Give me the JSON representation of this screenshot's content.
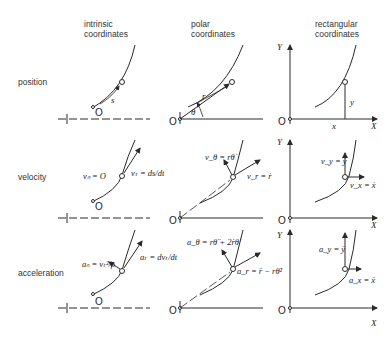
{
  "columns": {
    "intrinsic": [
      "intrinsic",
      "coordinates"
    ],
    "polar": [
      "polar",
      "coordinates"
    ],
    "rectangular": [
      "rectangular",
      "coordinates"
    ]
  },
  "rows": {
    "position": "position",
    "velocity": "velocity",
    "acceleration": "acceleration"
  },
  "labels": {
    "origin": "O",
    "s": "s",
    "r": "r",
    "theta": "θ",
    "x": "x",
    "y": "y",
    "X": "X",
    "Y": "Y",
    "vn": "vₙ = O",
    "vt": "vₜ = ds/dt",
    "vtheta": "v_θ = rθ̇",
    "vr": "v_r = ṙ",
    "vy": "v_y = ẏ",
    "vx": "v_x = ẋ",
    "an": "aₙ = vₜ²/ρ",
    "at": "aₜ = dvₜ/dt",
    "atheta": "a_θ = rθ̈ + 2ṙθ̇",
    "ar": "a_r = r̈ − rθ̇²",
    "ay": "a_y = ÿ",
    "ax": "a_x = ẍ"
  },
  "colors": {
    "ink": "#2a2a2a",
    "background": "#ffffff"
  }
}
